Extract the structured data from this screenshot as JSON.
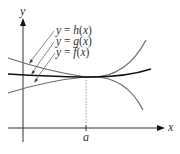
{
  "figure": {
    "type": "function-diagram"
  },
  "axes": {
    "x_label": "x",
    "y_label": "y",
    "tick_label": "a"
  },
  "curves": [
    {
      "name": "h",
      "label": "y = h(x)",
      "color": "#6a6a6a"
    },
    {
      "name": "g",
      "label": "y = g(x)",
      "color": "#111111"
    },
    {
      "name": "f",
      "label": "y = f(x)",
      "color": "#6a6a6a"
    }
  ],
  "labels": {
    "h": {
      "prefix": "y = ",
      "fn": "h",
      "arg": "(x)"
    },
    "g": {
      "prefix": "y = ",
      "fn": "g",
      "arg": "(x)"
    },
    "f": {
      "prefix": "y = ",
      "fn": "f",
      "arg": "(x)"
    }
  }
}
